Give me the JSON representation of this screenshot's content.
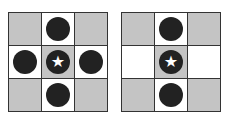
{
  "diagrams": [
    {
      "cells": [
        {
          "bg": "gray",
          "piece": "none"
        },
        {
          "bg": "white",
          "piece": "stone"
        },
        {
          "bg": "gray",
          "piece": "none"
        },
        {
          "bg": "white",
          "piece": "stone"
        },
        {
          "bg": "gray",
          "piece": "star-stone"
        },
        {
          "bg": "white",
          "piece": "stone"
        },
        {
          "bg": "gray",
          "piece": "none"
        },
        {
          "bg": "white",
          "piece": "stone"
        },
        {
          "bg": "gray",
          "piece": "none"
        }
      ]
    },
    {
      "cells": [
        {
          "bg": "gray",
          "piece": "none"
        },
        {
          "bg": "white",
          "piece": "stone"
        },
        {
          "bg": "gray",
          "piece": "none"
        },
        {
          "bg": "white",
          "piece": "none"
        },
        {
          "bg": "gray",
          "piece": "star-stone"
        },
        {
          "bg": "white",
          "piece": "none"
        },
        {
          "bg": "gray",
          "piece": "none"
        },
        {
          "bg": "white",
          "piece": "stone"
        },
        {
          "bg": "gray",
          "piece": "none"
        }
      ]
    }
  ],
  "star_glyph": "★",
  "colors": {
    "gray": "#c4c4c4",
    "white": "#ffffff",
    "stone": "#222222",
    "border": "#333333"
  }
}
